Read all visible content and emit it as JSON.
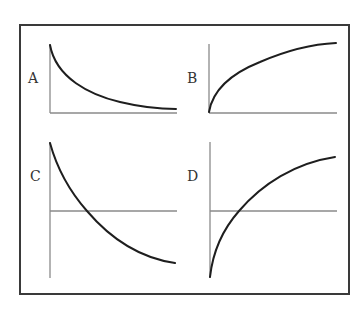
{
  "figure": {
    "type": "four-panel schematic curve diagram",
    "colors": {
      "frame": "#3a3a3a",
      "axis": "#8a8a8a",
      "curve": "#1e1e1e",
      "label": "#333333",
      "background": "#ffffff"
    }
  },
  "panels": [
    {
      "label": "A",
      "description": "Decreasing convex curve decaying toward the x-axis; y-axis and x-axis at bottom"
    },
    {
      "label": "B",
      "description": "Increasing concave curve starting at origin and leveling off; y-axis and x-axis at bottom"
    },
    {
      "label": "C",
      "description": "Decreasing convex curve crossing a horizontal axis at mid-height and continuing below it"
    },
    {
      "label": "D",
      "description": "Increasing concave curve starting below a horizontal mid-height axis, crossing it and leveling off"
    }
  ]
}
